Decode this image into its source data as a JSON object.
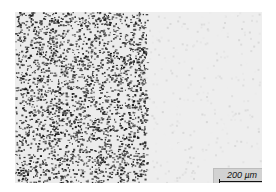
{
  "figure": {
    "scale_bar": {
      "label": "200 µm"
    },
    "colors": {
      "dots": "#2a2a2a",
      "left_bg": "#ececec",
      "right_bg": "#eeeeee",
      "scale_box": "#d2d2d2"
    }
  }
}
